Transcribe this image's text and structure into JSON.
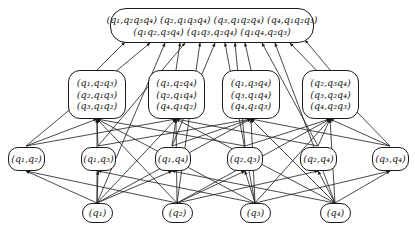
{
  "diagram": {
    "type": "lattice",
    "top": {
      "lines": [
        "(q₁,q₂q₃q₄) (q₂,q₁q₃q₄) (q₃,q₁q₂q₄) (q₄,q₁q₂q₃)",
        "(q₁q₂,q₃q₄) (q₁q₃,q₂q₄) (q₁q₄,q₂q₃)"
      ]
    },
    "middle": [
      {
        "lines": [
          "(q₁,q₂q₃)",
          "(q₂,q₁q₃)",
          "(q₃,q₁q₂)"
        ]
      },
      {
        "lines": [
          "(q₁,q₂q₄)",
          "(q₂,q₁q₄)",
          "(q₄,q₁q₂)"
        ]
      },
      {
        "lines": [
          "(q₁,q₃q₄)",
          "(q₃,q₁q₄)",
          "(q₄,q₁q₃)"
        ]
      },
      {
        "lines": [
          "(q₂,q₃q₄)",
          "(q₃,q₂q₄)",
          "(q₄,q₂q₃)"
        ]
      }
    ],
    "pairs": [
      {
        "label": "(q₁,q₂)"
      },
      {
        "label": "(q₁,q₃)"
      },
      {
        "label": "(q₁,q₄)"
      },
      {
        "label": "(q₂,q₃)"
      },
      {
        "label": "(q₂,q₄)"
      },
      {
        "label": "(q₃,q₄)"
      }
    ],
    "singletons": [
      {
        "label": "(q₁)"
      },
      {
        "label": "(q₂)"
      },
      {
        "label": "(q₃)"
      },
      {
        "label": "(q₄)"
      }
    ],
    "colors": {
      "stroke": "#1a1a1a",
      "background": "#ffffff"
    }
  }
}
